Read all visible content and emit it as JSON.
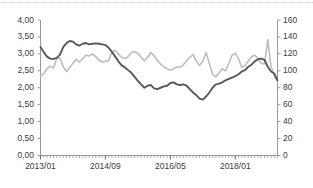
{
  "chart_data": {
    "type": "line",
    "title": "",
    "subtitle": "",
    "xlabel": "",
    "ylabel": "",
    "y2label": "",
    "grid": false,
    "legend": "none",
    "x_tick_labels": [
      "2013/01",
      "2014/09",
      "2016/05",
      "2018/01"
    ],
    "x_tick_indices": [
      0,
      20,
      40,
      60
    ],
    "x_tick_interval_months": 20,
    "x_minor_ticks": "monthly",
    "y_left_ticks": [
      "0,00",
      "0,50",
      "1,00",
      "1,50",
      "2,00",
      "2,50",
      "3,00",
      "3,50",
      "4,00"
    ],
    "y_left_values": [
      0,
      0.5,
      1,
      1.5,
      2,
      2.5,
      3,
      3.5,
      4
    ],
    "ylim": [
      0,
      4
    ],
    "y_right_ticks": [
      "0",
      "20",
      "40",
      "60",
      "80",
      "100",
      "120",
      "140",
      "160"
    ],
    "y_right_values": [
      0,
      20,
      40,
      60,
      80,
      100,
      120,
      140,
      160
    ],
    "y2lim": [
      0,
      160
    ],
    "x_start": "2013/01",
    "x_end": "2019/02",
    "n_points": 74,
    "series": [
      {
        "name": "series-dark",
        "axis": "left",
        "color": "#595959",
        "values": [
          3.2,
          3.05,
          2.92,
          2.86,
          2.85,
          2.88,
          2.98,
          3.2,
          3.32,
          3.38,
          3.36,
          3.28,
          3.24,
          3.3,
          3.32,
          3.28,
          3.3,
          3.31,
          3.3,
          3.28,
          3.26,
          3.18,
          3.06,
          2.92,
          2.78,
          2.66,
          2.6,
          2.52,
          2.44,
          2.32,
          2.2,
          2.1,
          2.0,
          2.06,
          2.08,
          1.98,
          1.96,
          2.0,
          2.04,
          2.06,
          2.14,
          2.16,
          2.1,
          2.08,
          2.1,
          2.06,
          1.96,
          1.86,
          1.78,
          1.68,
          1.65,
          1.74,
          1.86,
          2.0,
          2.1,
          2.12,
          2.16,
          2.22,
          2.26,
          2.3,
          2.34,
          2.4,
          2.48,
          2.52,
          2.62,
          2.68,
          2.78,
          2.84,
          2.86,
          2.82,
          2.62,
          2.48,
          2.42,
          2.22
        ]
      },
      {
        "name": "series-light",
        "axis": "right",
        "color": "#bdbdbd",
        "values_left_scale": [
          2.34,
          2.42,
          2.56,
          2.64,
          2.58,
          2.86,
          2.88,
          2.62,
          2.48,
          2.6,
          2.72,
          2.84,
          2.76,
          2.86,
          2.96,
          2.94,
          3.0,
          2.92,
          2.82,
          2.76,
          2.78,
          2.8,
          3.06,
          3.1,
          3.0,
          2.9,
          2.86,
          2.92,
          3.04,
          3.06,
          3.02,
          2.9,
          2.8,
          2.9,
          3.04,
          2.94,
          2.8,
          2.7,
          2.62,
          2.56,
          2.52,
          2.56,
          2.62,
          2.6,
          2.68,
          2.8,
          2.9,
          2.98,
          2.78,
          2.66,
          2.78,
          3.04,
          2.72,
          2.4,
          2.32,
          2.44,
          2.56,
          2.5,
          2.72,
          2.96,
          3.02,
          2.86,
          2.6,
          2.66,
          2.78,
          2.92,
          2.96,
          2.86,
          2.72,
          2.7,
          3.42,
          2.62,
          2.36,
          2.18
        ],
        "values": [
          94,
          97,
          102,
          106,
          103,
          114,
          115,
          105,
          99,
          104,
          109,
          114,
          110,
          114,
          118,
          118,
          120,
          117,
          113,
          110,
          111,
          112,
          122,
          124,
          120,
          116,
          114,
          117,
          122,
          122,
          121,
          116,
          112,
          116,
          122,
          118,
          112,
          108,
          105,
          102,
          101,
          102,
          105,
          104,
          107,
          112,
          116,
          119,
          111,
          106,
          111,
          122,
          109,
          96,
          93,
          98,
          102,
          100,
          109,
          118,
          121,
          114,
          104,
          106,
          111,
          117,
          118,
          114,
          109,
          108,
          137,
          105,
          94,
          87
        ]
      }
    ],
    "annotations": []
  }
}
